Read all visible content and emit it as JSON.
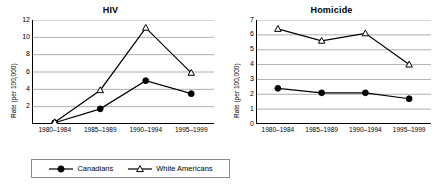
{
  "legend": {
    "entries": [
      {
        "label": "Canadians",
        "marker": "filled-circle-marker",
        "color": "#000000"
      },
      {
        "label": "White Americans",
        "marker": "open-triangle-marker",
        "color": "#000000"
      }
    ]
  },
  "chart_data": [
    {
      "type": "line",
      "title": "HIV",
      "xlabel": "",
      "ylabel": "Rate (per 100,000)",
      "categories": [
        "1980–1984",
        "1985–1989",
        "1990–1994",
        "1995–1999"
      ],
      "ylim": [
        0,
        12
      ],
      "yticks": [
        2,
        4,
        6,
        8,
        10,
        12
      ],
      "grid": true,
      "legend_position": "bottom",
      "series": [
        {
          "name": "Canadians",
          "marker": "filled-circle",
          "values": [
            0.15,
            1.75,
            5.0,
            3.5
          ]
        },
        {
          "name": "White Americans",
          "marker": "open-triangle",
          "values": [
            0.2,
            3.9,
            11.1,
            5.9
          ]
        }
      ]
    },
    {
      "type": "line",
      "title": "Homicide",
      "xlabel": "",
      "ylabel": "Rate (per 100,000)",
      "categories": [
        "1980–1984",
        "1985–1989",
        "1990–1994",
        "1995–1999"
      ],
      "ylim": [
        0,
        7
      ],
      "yticks": [
        0,
        1,
        2,
        3,
        4,
        5,
        6,
        7
      ],
      "grid": true,
      "legend_position": "bottom",
      "series": [
        {
          "name": "Canadians",
          "marker": "filled-circle",
          "values": [
            2.4,
            2.1,
            2.1,
            1.7
          ]
        },
        {
          "name": "White Americans",
          "marker": "open-triangle",
          "values": [
            6.4,
            5.6,
            6.1,
            4.0
          ]
        }
      ]
    }
  ]
}
